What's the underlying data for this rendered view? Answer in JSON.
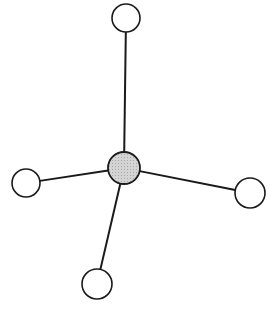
{
  "diagram": {
    "colors": {
      "background": "#ffffff",
      "stroke": "#1a1a1a",
      "central_fill": "#d4d4d4",
      "outer_fill": "#ffffff"
    },
    "central_atom": {
      "cx": 124,
      "cy": 168,
      "r": 16
    },
    "outer_atoms": [
      {
        "name": "top",
        "cx": 126,
        "cy": 18,
        "r": 14
      },
      {
        "name": "left",
        "cx": 26,
        "cy": 183,
        "r": 14
      },
      {
        "name": "right",
        "cx": 250,
        "cy": 193,
        "r": 15
      },
      {
        "name": "bottom",
        "cx": 97,
        "cy": 284,
        "r": 15
      }
    ]
  }
}
